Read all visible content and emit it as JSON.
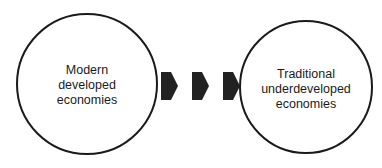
{
  "diagram": {
    "type": "flow",
    "nodes": [
      {
        "id": "left",
        "shape": "circle",
        "label": "Modern\ndeveloped\neconomies"
      },
      {
        "id": "right",
        "shape": "circle",
        "label": "Traditional\nunderdeveloped\neconomies"
      }
    ],
    "connector": {
      "style": "three block arrows",
      "direction": "left-to-right",
      "count": 3
    },
    "colors": {
      "stroke": "#1a1a1a",
      "arrow_fill": "#222222",
      "background": "#ffffff"
    }
  }
}
